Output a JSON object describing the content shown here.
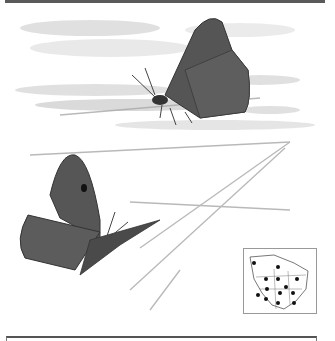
{
  "illustration": {
    "subject": "two butterflies (dark brown hairstreak/duskywing-like) perched and in flight over pale landscape",
    "colors": {
      "wing": "#4f4f4f",
      "wing_light": "#6e6e6e",
      "background_wash": "#d4d4d4",
      "frame": "#5a5a5a"
    }
  },
  "range_map": {
    "label": "North America range map",
    "dots": 13
  }
}
